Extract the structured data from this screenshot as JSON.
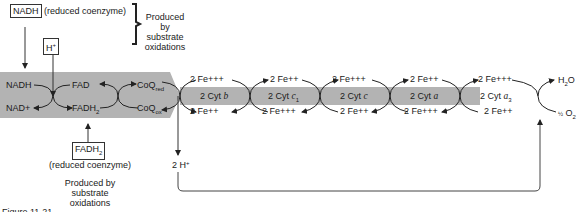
{
  "top": {
    "nadh_box": "NADH",
    "nadh_note": "(reduced coenzyme)",
    "bracket_note": [
      "Produced by",
      "substrate",
      "oxidations"
    ],
    "h_plus_box": "H+"
  },
  "bottom": {
    "fadh2_box": "FADH",
    "fadh2_sub": "2",
    "fadh2_note": "(reduced coenzyme)",
    "produced_note": [
      "Produced by",
      "substrate",
      "oxidations"
    ],
    "caption": "Figure 11-21"
  },
  "chain": {
    "nadh": "NADH",
    "nad_plus": "NAD+",
    "fad": "FAD",
    "fadh2": "FADH",
    "coq_red": "CoQ",
    "coq_red_sub": "red",
    "coq_ox": "CoQ",
    "coq_ox_sub": "ox",
    "cytochromes": [
      {
        "label": "2 Cyt",
        "name": "b",
        "sub": "",
        "top": "2 Fe+++",
        "bottom": "2 Fe++"
      },
      {
        "label": "2 Cyt",
        "name": "c",
        "sub": "1",
        "top": "2 Fe++",
        "bottom": "2 Fe+++"
      },
      {
        "label": "2 Cyt",
        "name": "c",
        "sub": "",
        "top": "2 Fe+++",
        "bottom": "2 Fe++"
      },
      {
        "label": "2 Cyt",
        "name": "a",
        "sub": "",
        "top": "2 Fe++",
        "bottom": "2 Fe+++"
      },
      {
        "label": "2 Cyt",
        "name": "a",
        "sub": "3",
        "top": "2 Fe+++",
        "bottom": "2 Fe++"
      }
    ],
    "water": "H2O",
    "oxygen": "1/2 O2",
    "two_h_plus": "2 H+"
  },
  "colors": {
    "band": "#b3b3b3",
    "line": "#333333"
  }
}
